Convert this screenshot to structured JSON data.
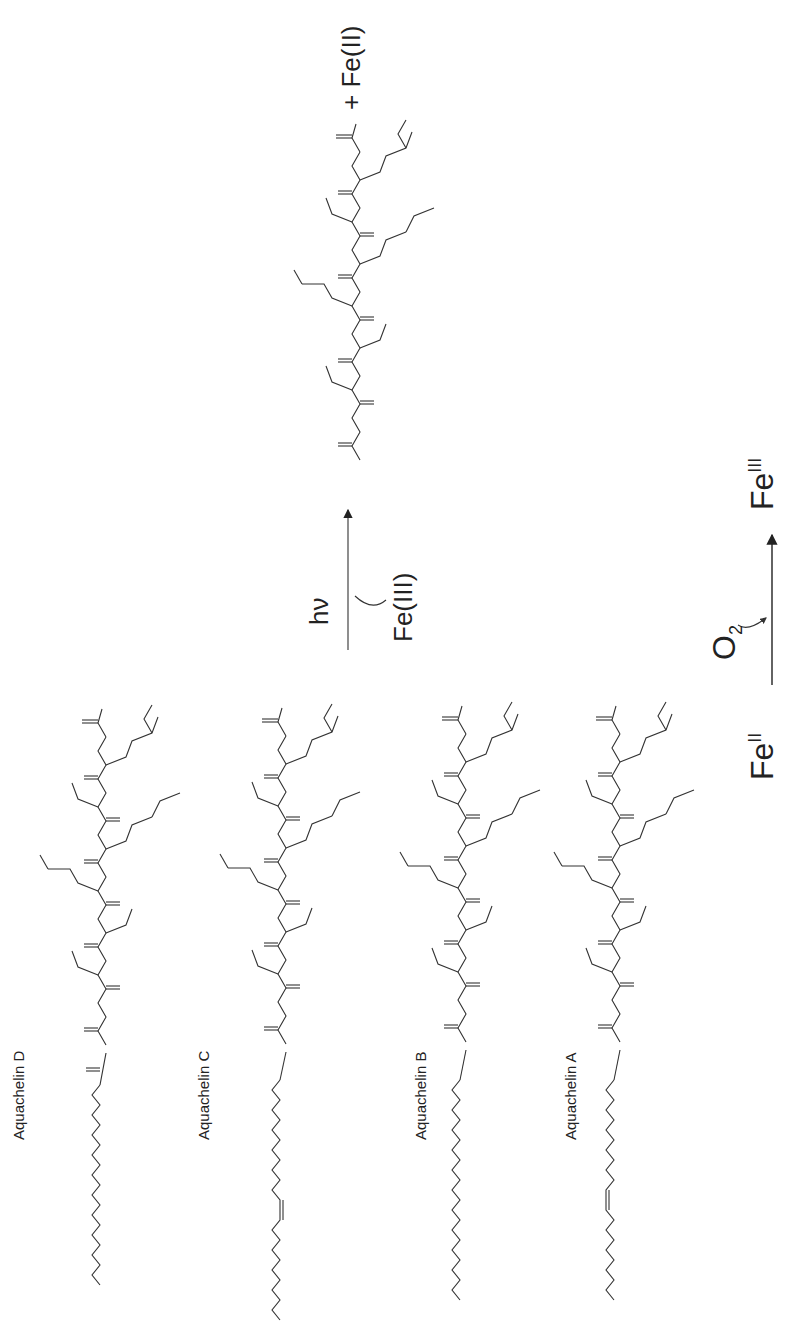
{
  "figure": {
    "orientation": "rotated-90-ccw",
    "reactants": [
      {
        "name": "Aquachelin D",
        "tail": "saturated",
        "tail_length": 12
      },
      {
        "name": "Aquachelin C",
        "tail": "unsaturated",
        "tail_length": 14
      },
      {
        "name": "Aquachelin B",
        "tail": "saturated",
        "tail_length": 12
      },
      {
        "name": "Aquachelin A",
        "tail": "unsaturated",
        "tail_length": 12
      }
    ],
    "atoms": {
      "oh": "OH",
      "ho": "HO",
      "nh": "NH",
      "hn": "HN",
      "o": "O",
      "n": "N",
      "h2n": "H2N",
      "h": "H"
    },
    "reaction_arrow": {
      "above": "hν",
      "below": "Fe(III)"
    },
    "product_suffix": "+ Fe(II)",
    "redox": {
      "left_base": "Fe",
      "left_sup": "II",
      "reagent_base": "O",
      "reagent_sub": "2",
      "right_base": "Fe",
      "right_sup": "III"
    }
  }
}
